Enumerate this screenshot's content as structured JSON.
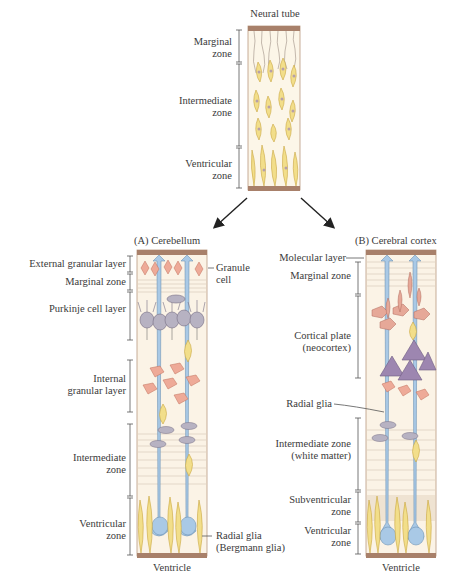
{
  "neural_tube": {
    "title": "Neural tube",
    "zones": [
      {
        "label_line1": "Marginal",
        "label_line2": "zone"
      },
      {
        "label_line1": "Intermediate",
        "label_line2": "zone"
      },
      {
        "label_line1": "Ventricular",
        "label_line2": "zone"
      }
    ]
  },
  "panel_a": {
    "title": "(A)  Cerebellum",
    "layers": [
      {
        "label_line1": "External granular layer"
      },
      {
        "label_line1": "Marginal zone"
      },
      {
        "label_line1": "Purkinje cell layer"
      },
      {
        "label_line1": "Internal",
        "label_line2": "granular layer"
      },
      {
        "label_line1": "Intermediate",
        "label_line2": "zone"
      },
      {
        "label_line1": "Ventricular",
        "label_line2": "zone"
      }
    ],
    "callouts": [
      {
        "label_line1": "Granule",
        "label_line2": "cell"
      },
      {
        "label_line1": "Radial glia",
        "label_line2": "(Bergmann glia)"
      }
    ],
    "bottom": "Ventricle"
  },
  "panel_b": {
    "title": "(B)  Cerebral cortex",
    "layers": [
      {
        "label_line1": "Molecular layer"
      },
      {
        "label_line1": "Marginal zone"
      },
      {
        "label_line1": "Cortical plate",
        "label_line2": "(neocortex)"
      },
      {
        "label_line1": "Radial glia"
      },
      {
        "label_line1": "Intermediate zone",
        "label_line2": "(white matter)"
      },
      {
        "label_line1": "Subventricular",
        "label_line2": "zone"
      },
      {
        "label_line1": "Ventricular",
        "label_line2": "zone"
      }
    ],
    "bottom": "Ventricle"
  },
  "colors": {
    "cap": "#a8806a",
    "column_bg": "#fbf3e6",
    "yellow_cell": "#f2de8a",
    "radial_glia": "#a9c9e6",
    "granule": "#eeaa98",
    "purkinje": "#b7b2c2",
    "pyramidal": "#9d86b0",
    "fiber": "#8a7a70"
  }
}
